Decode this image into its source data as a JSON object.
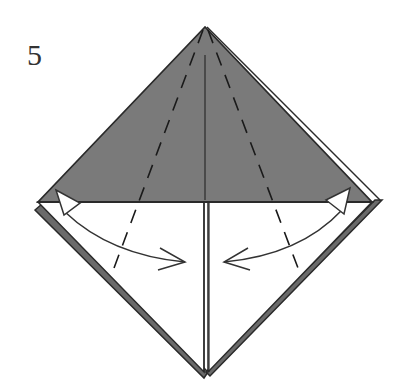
{
  "step": {
    "number": "5"
  },
  "colors": {
    "paper_colored": "#7a7a7a",
    "paper_white": "#ffffff",
    "line": "#2a2a2a",
    "layer_edge": "#6a6a6a"
  },
  "diagram": {
    "elements": [
      "top-colored-triangle",
      "bottom-white-flaps",
      "center-crease",
      "valley-fold-lines",
      "fold-arrows"
    ]
  }
}
